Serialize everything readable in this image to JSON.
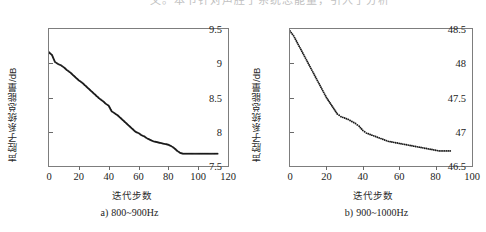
{
  "top_cropped_text": "文。本节针对声腔子系统总能量，引入了分析",
  "figures": [
    {
      "key": "left",
      "caption_index": "a)",
      "caption_text": "800~900Hz",
      "xlabel": "迭代步数",
      "ylabel": "声腔子系统总能量/dB",
      "chart_data": {
        "type": "line",
        "title": "",
        "xlabel": "迭代步数",
        "ylabel": "声腔子系统总能量/dB",
        "xlim": [
          0,
          120
        ],
        "ylim": [
          7.5,
          9.5
        ],
        "xticks": [
          0,
          20,
          40,
          60,
          80,
          100,
          120
        ],
        "yticks": [
          7.5,
          8,
          8.5,
          9,
          9.5
        ],
        "xtick_labels": [
          "0",
          "20",
          "40",
          "60",
          "80",
          "100",
          "120"
        ],
        "ytick_labels": [
          "7.5",
          "8",
          "8.5",
          "9",
          "9.5"
        ],
        "grid": false,
        "legend": "none",
        "marker": "dot-dense",
        "series": [
          {
            "name": "声腔子系统总能量",
            "x": [
              0,
              2,
              4,
              6,
              8,
              10,
              12,
              14,
              16,
              18,
              20,
              22,
              24,
              26,
              28,
              30,
              32,
              34,
              36,
              38,
              40,
              42,
              44,
              46,
              48,
              50,
              52,
              54,
              56,
              58,
              60,
              62,
              64,
              66,
              68,
              70,
              72,
              74,
              76,
              78,
              80,
              82,
              84,
              86,
              88,
              90,
              95,
              100,
              105,
              110,
              113
            ],
            "values": [
              9.16,
              9.12,
              9.02,
              8.99,
              8.97,
              8.94,
              8.9,
              8.87,
              8.83,
              8.79,
              8.75,
              8.72,
              8.68,
              8.64,
              8.6,
              8.56,
              8.52,
              8.48,
              8.45,
              8.41,
              8.38,
              8.3,
              8.27,
              8.24,
              8.2,
              8.16,
              8.12,
              8.08,
              8.04,
              8.0,
              7.98,
              7.95,
              7.93,
              7.9,
              7.88,
              7.86,
              7.85,
              7.84,
              7.83,
              7.82,
              7.81,
              7.79,
              7.76,
              7.72,
              7.69,
              7.68,
              7.68,
              7.68,
              7.68,
              7.68,
              7.68
            ]
          }
        ]
      }
    },
    {
      "key": "right",
      "caption_index": "b)",
      "caption_text": "900~1000Hz",
      "xlabel": "迭代步数",
      "ylabel": "声腔子系统总能量/dB",
      "chart_data": {
        "type": "line",
        "title": "",
        "xlabel": "迭代步数",
        "ylabel": "声腔子系统总能量/dB",
        "xlim": [
          0,
          100
        ],
        "ylim": [
          46.5,
          48.5
        ],
        "xticks": [
          0,
          20,
          40,
          60,
          80,
          100
        ],
        "yticks": [
          46.5,
          47,
          47.5,
          48,
          48.5
        ],
        "xtick_labels": [
          "0",
          "20",
          "40",
          "60",
          "80",
          "100"
        ],
        "ytick_labels": [
          "46.5",
          "47",
          "47.5",
          "48",
          "48.5"
        ],
        "grid": false,
        "legend": "none",
        "marker": "dot-sparse",
        "series": [
          {
            "name": "声腔子系统总能量",
            "x": [
              0,
              2,
              4,
              6,
              8,
              10,
              12,
              14,
              16,
              18,
              20,
              22,
              24,
              26,
              28,
              30,
              32,
              34,
              36,
              38,
              40,
              42,
              44,
              46,
              48,
              50,
              52,
              54,
              56,
              58,
              60,
              62,
              64,
              66,
              68,
              70,
              72,
              74,
              76,
              78,
              80,
              82,
              84,
              86,
              88
            ],
            "values": [
              48.47,
              48.4,
              48.3,
              48.2,
              48.1,
              48.0,
              47.9,
              47.8,
              47.7,
              47.6,
              47.5,
              47.42,
              47.34,
              47.26,
              47.22,
              47.2,
              47.18,
              47.15,
              47.12,
              47.08,
              47.02,
              46.98,
              46.96,
              46.94,
              46.92,
              46.9,
              46.88,
              46.86,
              46.85,
              46.84,
              46.83,
              46.82,
              46.81,
              46.8,
              46.79,
              46.78,
              46.77,
              46.76,
              46.75,
              46.74,
              46.73,
              46.72,
              46.72,
              46.72,
              46.72
            ]
          }
        ]
      }
    }
  ],
  "colors": {
    "line": "#1a1a1a",
    "frame": "#7d7d7d",
    "text": "#1c1c1c",
    "background": "#ffffff"
  }
}
